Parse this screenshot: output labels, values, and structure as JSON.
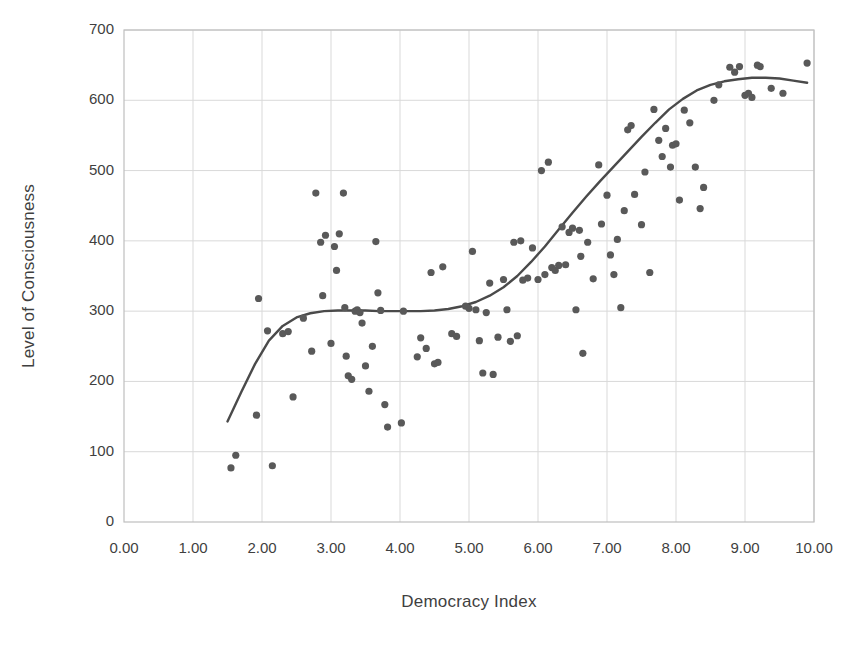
{
  "chart_data": {
    "type": "scatter",
    "title": "",
    "xlabel": "Democracy Index",
    "ylabel": "Level of Consciousness",
    "xlim": [
      0,
      10
    ],
    "ylim": [
      0,
      700
    ],
    "xticks": [
      "0.00",
      "1.00",
      "2.00",
      "3.00",
      "4.00",
      "5.00",
      "6.00",
      "7.00",
      "8.00",
      "9.00",
      "10.00"
    ],
    "yticks": [
      "0",
      "100",
      "200",
      "300",
      "400",
      "500",
      "600",
      "700"
    ],
    "xtick_values": [
      0,
      1,
      2,
      3,
      4,
      5,
      6,
      7,
      8,
      9,
      10
    ],
    "ytick_values": [
      0,
      100,
      200,
      300,
      400,
      500,
      600,
      700
    ],
    "grid": true,
    "legend": "none",
    "point_color": "#595959",
    "point_radius": 3.6,
    "line_color": "#4a4a4a",
    "line_width": 2.4,
    "grid_color": "#d9d9d9",
    "axis_color": "#bfbfbf",
    "points": [
      [
        1.55,
        77
      ],
      [
        1.62,
        95
      ],
      [
        2.15,
        80
      ],
      [
        1.95,
        318
      ],
      [
        1.92,
        152
      ],
      [
        2.08,
        272
      ],
      [
        2.3,
        268
      ],
      [
        2.38,
        271
      ],
      [
        2.45,
        178
      ],
      [
        2.6,
        290
      ],
      [
        2.72,
        243
      ],
      [
        2.78,
        468
      ],
      [
        2.85,
        398
      ],
      [
        2.92,
        408
      ],
      [
        2.88,
        322
      ],
      [
        3.0,
        254
      ],
      [
        3.05,
        392
      ],
      [
        3.08,
        358
      ],
      [
        3.12,
        410
      ],
      [
        3.18,
        468
      ],
      [
        3.2,
        305
      ],
      [
        3.22,
        236
      ],
      [
        3.25,
        208
      ],
      [
        3.3,
        203
      ],
      [
        3.35,
        300
      ],
      [
        3.38,
        302
      ],
      [
        3.42,
        298
      ],
      [
        3.45,
        283
      ],
      [
        3.5,
        222
      ],
      [
        3.55,
        186
      ],
      [
        3.6,
        250
      ],
      [
        3.65,
        399
      ],
      [
        3.68,
        326
      ],
      [
        3.72,
        301
      ],
      [
        3.78,
        167
      ],
      [
        3.82,
        135
      ],
      [
        4.02,
        141
      ],
      [
        4.05,
        300
      ],
      [
        4.25,
        235
      ],
      [
        4.3,
        262
      ],
      [
        4.38,
        247
      ],
      [
        4.45,
        355
      ],
      [
        4.5,
        225
      ],
      [
        4.55,
        227
      ],
      [
        4.62,
        363
      ],
      [
        4.75,
        268
      ],
      [
        4.82,
        264
      ],
      [
        4.95,
        307
      ],
      [
        5.0,
        304
      ],
      [
        5.05,
        385
      ],
      [
        5.1,
        302
      ],
      [
        5.15,
        258
      ],
      [
        5.2,
        212
      ],
      [
        5.25,
        298
      ],
      [
        5.3,
        340
      ],
      [
        5.35,
        210
      ],
      [
        5.42,
        263
      ],
      [
        5.5,
        345
      ],
      [
        5.55,
        302
      ],
      [
        5.6,
        257
      ],
      [
        5.65,
        398
      ],
      [
        5.7,
        265
      ],
      [
        5.75,
        400
      ],
      [
        5.78,
        344
      ],
      [
        5.85,
        347
      ],
      [
        5.92,
        390
      ],
      [
        6.0,
        345
      ],
      [
        6.05,
        500
      ],
      [
        6.1,
        352
      ],
      [
        6.15,
        512
      ],
      [
        6.2,
        362
      ],
      [
        6.25,
        358
      ],
      [
        6.3,
        365
      ],
      [
        6.35,
        420
      ],
      [
        6.4,
        366
      ],
      [
        6.45,
        412
      ],
      [
        6.5,
        418
      ],
      [
        6.55,
        302
      ],
      [
        6.6,
        415
      ],
      [
        6.62,
        378
      ],
      [
        6.65,
        240
      ],
      [
        6.72,
        398
      ],
      [
        6.8,
        346
      ],
      [
        6.88,
        508
      ],
      [
        6.92,
        424
      ],
      [
        7.0,
        465
      ],
      [
        7.05,
        380
      ],
      [
        7.1,
        352
      ],
      [
        7.15,
        402
      ],
      [
        7.2,
        305
      ],
      [
        7.25,
        443
      ],
      [
        7.3,
        558
      ],
      [
        7.35,
        564
      ],
      [
        7.4,
        466
      ],
      [
        7.5,
        423
      ],
      [
        7.55,
        498
      ],
      [
        7.62,
        355
      ],
      [
        7.68,
        587
      ],
      [
        7.75,
        543
      ],
      [
        7.8,
        520
      ],
      [
        7.85,
        560
      ],
      [
        7.92,
        505
      ],
      [
        7.95,
        536
      ],
      [
        8.0,
        538
      ],
      [
        8.05,
        458
      ],
      [
        8.12,
        586
      ],
      [
        8.2,
        568
      ],
      [
        8.28,
        505
      ],
      [
        8.35,
        446
      ],
      [
        8.4,
        476
      ],
      [
        8.55,
        600
      ],
      [
        8.62,
        622
      ],
      [
        8.78,
        647
      ],
      [
        8.85,
        640
      ],
      [
        8.92,
        648
      ],
      [
        9.0,
        607
      ],
      [
        9.05,
        610
      ],
      [
        9.1,
        604
      ],
      [
        9.18,
        650
      ],
      [
        9.22,
        648
      ],
      [
        9.38,
        617
      ],
      [
        9.55,
        610
      ],
      [
        9.9,
        653
      ]
    ],
    "trend_line": [
      [
        1.5,
        143
      ],
      [
        1.7,
        185
      ],
      [
        1.9,
        225
      ],
      [
        2.1,
        258
      ],
      [
        2.3,
        279
      ],
      [
        2.5,
        291
      ],
      [
        2.7,
        297
      ],
      [
        2.9,
        300
      ],
      [
        3.1,
        301
      ],
      [
        3.3,
        301
      ],
      [
        3.5,
        301
      ],
      [
        3.7,
        300
      ],
      [
        3.9,
        300
      ],
      [
        4.1,
        300
      ],
      [
        4.3,
        300
      ],
      [
        4.5,
        301
      ],
      [
        4.7,
        303
      ],
      [
        4.9,
        307
      ],
      [
        5.1,
        313
      ],
      [
        5.3,
        322
      ],
      [
        5.5,
        334
      ],
      [
        5.7,
        350
      ],
      [
        5.9,
        370
      ],
      [
        6.1,
        392
      ],
      [
        6.3,
        416
      ],
      [
        6.5,
        440
      ],
      [
        6.7,
        463
      ],
      [
        6.9,
        485
      ],
      [
        7.1,
        506
      ],
      [
        7.3,
        527
      ],
      [
        7.5,
        548
      ],
      [
        7.7,
        568
      ],
      [
        7.9,
        587
      ],
      [
        8.1,
        602
      ],
      [
        8.3,
        614
      ],
      [
        8.5,
        622
      ],
      [
        8.7,
        627
      ],
      [
        8.9,
        630
      ],
      [
        9.1,
        632
      ],
      [
        9.3,
        632
      ],
      [
        9.5,
        631
      ],
      [
        9.7,
        628
      ],
      [
        9.9,
        625
      ]
    ]
  }
}
